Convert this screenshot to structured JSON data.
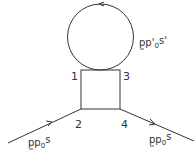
{
  "diagram": {
    "type": "feynman-box-with-loop",
    "line_color": "#333333",
    "vertices": [
      {
        "id": "v1",
        "label": "1"
      },
      {
        "id": "v2",
        "label": "2"
      },
      {
        "id": "v3",
        "label": "3"
      },
      {
        "id": "v4",
        "label": "4"
      }
    ],
    "loop": {
      "label_main": "pp",
      "label_prime": "'",
      "label_sub": "0",
      "label_sup": "s'",
      "arrow_direction": "counter-clockwise"
    },
    "incoming": {
      "label_main": "pp",
      "label_sub": "0",
      "label_sup": "s"
    },
    "outgoing": {
      "label_main": "pp",
      "label_sub": "0",
      "label_sup": "s"
    }
  }
}
